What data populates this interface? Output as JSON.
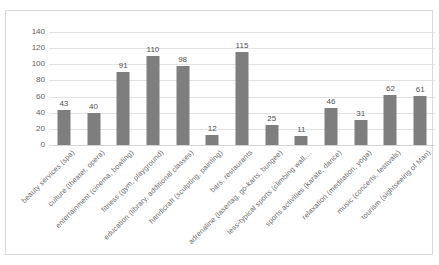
{
  "chart_data": {
    "type": "bar",
    "title": "",
    "subtitle": "",
    "xlabel": "",
    "ylabel": "",
    "ylim": [
      0,
      140
    ],
    "grid": true,
    "legend": false,
    "orientation": "vertical",
    "bar_color": "#7e7e7e",
    "gridline_color": "#e2e2e2",
    "label_rotation": "-45",
    "categories": [
      "beauty services (spa)",
      "culture (theater, opera)",
      "entertainment (cinema, bowling)",
      "fitness (gym, playground)",
      "education (library, additional classes)",
      "handicraft (sculpting, painting)",
      "bars, restaurants",
      "adrenaline (lasertag, go-karts, bungee)",
      "less-typical sports (climbing wall,...",
      "sports activities (karate, dance)",
      "relaxation (meditation, yoga)",
      "music (concerts, festivals)",
      "tourism (sightseeing of Man)"
    ],
    "values": [
      43,
      40,
      91,
      110,
      98,
      12,
      115,
      25,
      11,
      46,
      31,
      62,
      61
    ],
    "data_labels": [
      "43",
      "40",
      "91",
      "110",
      "98",
      "12",
      "115",
      "25",
      "11",
      "46",
      "31",
      "62",
      "61"
    ],
    "yticks": [
      0,
      20,
      40,
      60,
      80,
      100,
      120,
      140
    ],
    "ytick_labels": [
      "0",
      "20",
      "40",
      "60",
      "80",
      "100",
      "120",
      "140"
    ]
  }
}
